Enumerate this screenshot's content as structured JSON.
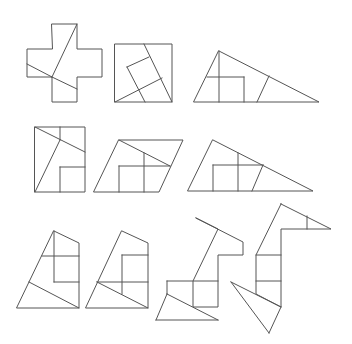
{
  "diagram": {
    "stroke_color": "#555555",
    "background": "#ffffff",
    "figures": [
      {
        "id": "cross",
        "outline": [
          [
            52,
            24
          ],
          [
            77,
            24
          ],
          [
            77,
            49
          ],
          [
            102,
            49
          ],
          [
            102,
            77
          ],
          [
            77,
            77
          ],
          [
            77,
            102
          ],
          [
            52,
            102
          ],
          [
            52,
            77
          ],
          [
            27,
            77
          ],
          [
            27,
            49
          ],
          [
            52,
            49
          ]
        ],
        "cuts": [
          [
            [
              77,
              24
            ],
            [
              52,
              77
            ]
          ],
          [
            [
              27,
              64
            ],
            [
              52,
              77
            ]
          ],
          [
            [
              52,
              77
            ],
            [
              77,
              89
            ]
          ]
        ]
      },
      {
        "id": "square",
        "outline": [
          [
            115,
            44
          ],
          [
            172,
            44
          ],
          [
            172,
            102
          ],
          [
            115,
            102
          ]
        ],
        "cuts": [
          [
            [
              144,
              44
            ],
            [
              172,
              102
            ]
          ],
          [
            [
              115,
              102
            ],
            [
              162,
              78
            ]
          ],
          [
            [
              127,
              67
            ],
            [
              149,
              57
            ]
          ],
          [
            [
              127,
              67
            ],
            [
              145,
              102
            ]
          ]
        ]
      },
      {
        "id": "triangle-1",
        "outline": [
          [
            219,
            51
          ],
          [
            319,
            102
          ],
          [
            194,
            102
          ]
        ],
        "cuts": [
          [
            [
              219,
              51
            ],
            [
              219,
              102
            ]
          ],
          [
            [
              207,
              77
            ],
            [
              244,
              77
            ]
          ],
          [
            [
              244,
              77
            ],
            [
              244,
              102
            ]
          ],
          [
            [
              257,
              102
            ],
            [
              269,
              76
            ]
          ]
        ]
      },
      {
        "id": "rectangle",
        "outline": [
          [
            35,
            127
          ],
          [
            85,
            127
          ],
          [
            85,
            192
          ],
          [
            35,
            192
          ]
        ],
        "cuts": [
          [
            [
              35,
              127
            ],
            [
              85,
              152
            ]
          ],
          [
            [
              60,
              127
            ],
            [
              60,
              140
            ]
          ],
          [
            [
              60,
              140
            ],
            [
              35,
              192
            ]
          ],
          [
            [
              60,
              167
            ],
            [
              85,
              167
            ]
          ],
          [
            [
              60,
              167
            ],
            [
              60,
              192
            ]
          ]
        ]
      },
      {
        "id": "parallelogram",
        "outline": [
          [
            119,
            140
          ],
          [
            183,
            140
          ],
          [
            159,
            192
          ],
          [
            94,
            192
          ]
        ],
        "cuts": [
          [
            [
              119,
              140
            ],
            [
              170,
              166
            ]
          ],
          [
            [
              119,
              166
            ],
            [
              170,
              166
            ]
          ],
          [
            [
              119,
              166
            ],
            [
              119,
              192
            ]
          ],
          [
            [
              144,
              153
            ],
            [
              144,
              192
            ]
          ]
        ]
      },
      {
        "id": "triangle-2",
        "outline": [
          [
            213,
            140
          ],
          [
            313,
            191
          ],
          [
            188,
            191
          ]
        ],
        "cuts": [
          [
            [
              213,
              165
            ],
            [
              263,
              165
            ]
          ],
          [
            [
              213,
              165
            ],
            [
              213,
              191
            ]
          ],
          [
            [
              238,
              153
            ],
            [
              238,
              191
            ]
          ],
          [
            [
              263,
              165
            ],
            [
              252,
              191
            ]
          ]
        ]
      },
      {
        "id": "trapezoid-1",
        "outline": [
          [
            54,
            231
          ],
          [
            79,
            243
          ],
          [
            79,
            308
          ],
          [
            17,
            308
          ]
        ],
        "cuts": [
          [
            [
              42,
              256
            ],
            [
              79,
              256
            ]
          ],
          [
            [
              54,
              231
            ],
            [
              54,
              282
            ]
          ],
          [
            [
              54,
              282
            ],
            [
              79,
              282
            ]
          ],
          [
            [
              29,
              282
            ],
            [
              79,
              308
            ]
          ]
        ]
      },
      {
        "id": "trapezoid-2",
        "outline": [
          [
            122,
            231
          ],
          [
            148,
            243
          ],
          [
            148,
            308
          ],
          [
            86,
            308
          ]
        ],
        "cuts": [
          [
            [
              122,
              255
            ],
            [
              148,
              255
            ]
          ],
          [
            [
              122,
              255
            ],
            [
              122,
              294
            ]
          ],
          [
            [
              97,
              282
            ],
            [
              148,
              282
            ]
          ],
          [
            [
              97,
              282
            ],
            [
              148,
              308
            ]
          ]
        ]
      },
      {
        "id": "animal-1",
        "outline": [
          [
            196,
            218
          ],
          [
            243,
            242
          ],
          [
            243,
            255
          ],
          [
            218,
            255
          ],
          [
            218,
            307
          ],
          [
            193,
            307
          ],
          [
            193,
            281
          ],
          [
            218,
            229
          ],
          [
            196,
            218
          ]
        ],
        "cuts": [
          [
            [
              167,
              281
            ],
            [
              218,
              281
            ]
          ],
          [
            [
              167,
              281
            ],
            [
              167,
              294
            ]
          ],
          [
            [
              167,
              294
            ],
            [
              218,
              320
            ]
          ],
          [
            [
              167,
              294
            ],
            [
              156,
              320
            ]
          ],
          [
            [
              156,
              320
            ],
            [
              218,
              320
            ]
          ]
        ]
      },
      {
        "id": "swan",
        "outline": [
          [
            281,
            204
          ],
          [
            331,
            229
          ],
          [
            281,
            229
          ],
          [
            281,
            307
          ],
          [
            256,
            294
          ],
          [
            256,
            255
          ],
          [
            281,
            204
          ]
        ],
        "cuts": [
          [
            [
              307,
              216
            ],
            [
              307,
              229
            ]
          ],
          [
            [
              256,
              255
            ],
            [
              281,
              255
            ]
          ],
          [
            [
              256,
              281
            ],
            [
              281,
              281
            ]
          ],
          [
            [
              231,
              282
            ],
            [
              281,
              307
            ]
          ],
          [
            [
              231,
              282
            ],
            [
              269,
              333
            ]
          ],
          [
            [
              269,
              333
            ],
            [
              281,
              307
            ]
          ]
        ]
      }
    ]
  }
}
